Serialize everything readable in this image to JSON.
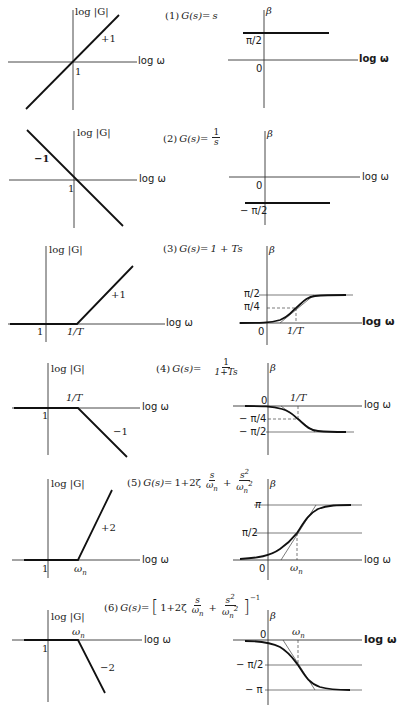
{
  "figure": {
    "axis_labels": {
      "magnitude": "log |G|",
      "phase": "β",
      "frequency": "log ω",
      "frequency_bold": "log ω"
    },
    "panels": [
      {
        "id": 1,
        "title_prefix": "(1)",
        "title_lhs": "G(s)=",
        "title_expr": "s",
        "magnitude": {
          "slope_label": "+1",
          "unity_label": "1"
        },
        "phase": {
          "level_label": "π/2",
          "zero_label": "0"
        }
      },
      {
        "id": 2,
        "title_prefix": "(2)",
        "title_lhs": "G(s)=",
        "title_num": "1",
        "title_den": "s",
        "magnitude": {
          "slope_label": "−1",
          "unity_label": "1"
        },
        "phase": {
          "level_label": "− π/2",
          "zero_label": "0"
        }
      },
      {
        "id": 3,
        "title_prefix": "(3)",
        "title_lhs": "G(s)=",
        "title_expr": "1 + Ts",
        "magnitude": {
          "slope_label": "+1",
          "unity_label": "1",
          "corner_label": "1/T"
        },
        "phase": {
          "upper_label": "π/2",
          "mid_label": "π/4",
          "zero_label": "0",
          "corner_label": "1/T"
        }
      },
      {
        "id": 4,
        "title_prefix": "(4)",
        "title_lhs": "G(s)=",
        "title_num": "1",
        "title_den": "1+Ts",
        "magnitude": {
          "slope_label": "−1",
          "unity_label": "1",
          "corner_label": "1/T"
        },
        "phase": {
          "mid_label": "− π/4",
          "lower_label": "− π/2",
          "zero_label": "0",
          "corner_label": "1/T"
        }
      },
      {
        "id": 5,
        "title_prefix": "(5)",
        "title_lhs": "G(s)=",
        "title_term1": "1+2ζ",
        "title_frac1_num": "s",
        "title_frac1_den": "ω",
        "title_frac1_den_sub": "n",
        "title_plus": "+",
        "title_frac2_num": "s",
        "title_frac2_num_sup": "2",
        "title_frac2_den": "ω",
        "title_frac2_den_sub": "n",
        "title_frac2_den_sup": "2",
        "magnitude": {
          "slope_label": "+2",
          "unity_label": "1",
          "corner_label": "ω",
          "corner_sub": "n"
        },
        "phase": {
          "upper_label": "π",
          "mid_label": "π/2",
          "zero_label": "0",
          "corner_label": "ω",
          "corner_sub": "n"
        }
      },
      {
        "id": 6,
        "title_prefix": "(6)",
        "title_lhs": "G(s)=",
        "title_open": "[",
        "title_term1": "1+2ζ",
        "title_frac1_num": "s",
        "title_frac1_den": "ω",
        "title_frac1_den_sub": "n",
        "title_plus": "+",
        "title_frac2_num": "s",
        "title_frac2_num_sup": "2",
        "title_frac2_den": "ω",
        "title_frac2_den_sub": "n",
        "title_frac2_den_sup": "2",
        "title_close": "]",
        "title_exp": "−1",
        "magnitude": {
          "slope_label": "−2",
          "unity_label": "1",
          "corner_label": "ω",
          "corner_sub": "n"
        },
        "phase": {
          "mid_label": "− π/2",
          "lower_label": "− π",
          "zero_label": "0",
          "corner_label": "ω",
          "corner_sub": "n"
        }
      }
    ]
  }
}
